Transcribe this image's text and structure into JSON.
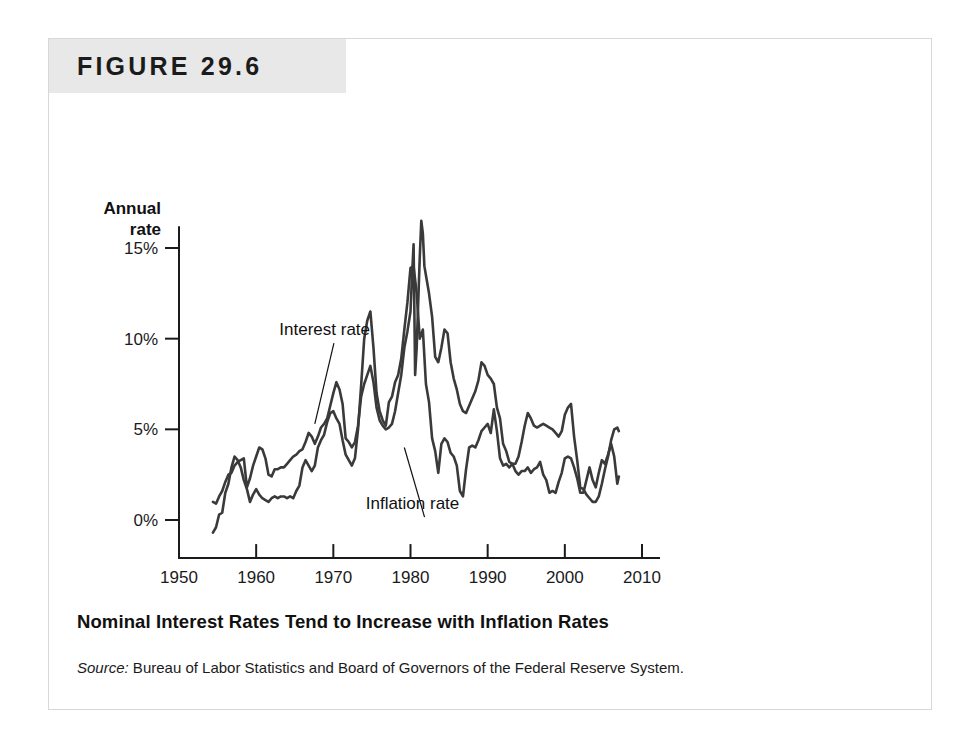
{
  "figure": {
    "number_label": "FIGURE 29.6",
    "caption": "Nominal Interest Rates Tend to Increase with Inflation Rates",
    "source_label": "Source:",
    "source_text": " Bureau of Labor Statistics and Board of Governors of the Federal Reserve System."
  },
  "chart_data": {
    "type": "line",
    "title": "Nominal Interest Rates Tend to Increase with Inflation Rates",
    "xlabel": "Year",
    "ylabel": "Annual rate",
    "ylabel_line1": "Annual",
    "ylabel_line2": "rate",
    "xlim": [
      1950,
      2010
    ],
    "ylim": [
      -2,
      17
    ],
    "grid": false,
    "legend_position": "inline-annotations",
    "xticks": [
      1950,
      1960,
      1970,
      1980,
      1990,
      2000,
      2010
    ],
    "xtick_labels": [
      "1950",
      "1960",
      "1970",
      "1980",
      "1990",
      "2000",
      "2010"
    ],
    "yticks": [
      0,
      5,
      10,
      15
    ],
    "ytick_labels": [
      "0%",
      "5%",
      "10%",
      "15%"
    ],
    "annotations": [
      {
        "label": "Interest rate",
        "text_x": 1963.0,
        "text_y": 10.2,
        "point_x": 1967.6,
        "point_y": 5.3
      },
      {
        "label": "Inflation rate",
        "text_x": 1974.2,
        "text_y": 0.6,
        "point_x": 1979.2,
        "point_y": 4.0
      }
    ],
    "series": [
      {
        "name": "Interest rate",
        "color": "#3a3a3a",
        "x": [
          1954.4,
          1954.8,
          1955.2,
          1955.6,
          1956.0,
          1956.4,
          1956.8,
          1957.2,
          1957.6,
          1958.0,
          1958.4,
          1958.8,
          1959.2,
          1959.6,
          1960.0,
          1960.4,
          1960.8,
          1961.2,
          1961.6,
          1962.0,
          1962.4,
          1962.8,
          1963.2,
          1963.6,
          1964.0,
          1964.4,
          1964.8,
          1965.2,
          1965.6,
          1966.0,
          1966.4,
          1966.8,
          1967.2,
          1967.6,
          1968.0,
          1968.4,
          1968.8,
          1969.2,
          1969.6,
          1970.0,
          1970.4,
          1970.8,
          1971.2,
          1971.6,
          1972.0,
          1972.4,
          1972.8,
          1973.2,
          1973.6,
          1974.0,
          1974.4,
          1974.8,
          1975.2,
          1975.6,
          1976.0,
          1976.4,
          1976.8,
          1977.2,
          1977.6,
          1978.0,
          1978.4,
          1978.8,
          1979.2,
          1979.6,
          1980.0,
          1980.2,
          1980.4,
          1980.6,
          1980.8,
          1981.0,
          1981.2,
          1981.4,
          1981.6,
          1981.8,
          1982.0,
          1982.4,
          1982.8,
          1983.2,
          1983.6,
          1984.0,
          1984.4,
          1984.8,
          1985.2,
          1985.6,
          1986.0,
          1986.4,
          1986.8,
          1987.2,
          1987.6,
          1988.0,
          1988.4,
          1988.8,
          1989.2,
          1989.6,
          1990.0,
          1990.4,
          1990.8,
          1991.2,
          1991.6,
          1992.0,
          1992.4,
          1992.8,
          1993.2,
          1993.6,
          1994.0,
          1994.4,
          1994.8,
          1995.2,
          1995.6,
          1996.0,
          1996.4,
          1996.8,
          1997.2,
          1997.6,
          1998.0,
          1998.4,
          1998.8,
          1999.2,
          1999.6,
          2000.0,
          2000.4,
          2000.8,
          2001.2,
          2001.6,
          2002.0,
          2002.4,
          2002.8,
          2003.2,
          2003.6,
          2004.0,
          2004.4,
          2004.8,
          2005.2,
          2005.6,
          2006.0,
          2006.4,
          2006.8,
          2007.0
        ],
        "y": [
          1.0,
          0.9,
          1.3,
          1.6,
          2.1,
          2.5,
          2.6,
          3.0,
          3.2,
          3.3,
          3.4,
          1.8,
          2.3,
          3.0,
          3.5,
          4.0,
          3.9,
          3.4,
          2.5,
          2.4,
          2.8,
          2.8,
          2.9,
          2.9,
          3.1,
          3.3,
          3.5,
          3.6,
          3.8,
          3.9,
          4.3,
          4.8,
          4.6,
          4.2,
          4.6,
          5.1,
          5.3,
          5.6,
          6.3,
          7.0,
          7.6,
          7.2,
          6.4,
          4.5,
          4.3,
          4.0,
          4.3,
          5.2,
          6.8,
          7.5,
          8.0,
          8.5,
          7.6,
          6.2,
          5.5,
          5.2,
          5.0,
          5.1,
          5.3,
          6.0,
          7.0,
          8.0,
          9.5,
          10.4,
          11.5,
          13.5,
          15.2,
          8.0,
          9.5,
          12.0,
          14.5,
          16.5,
          15.8,
          14.0,
          13.5,
          12.5,
          11.2,
          9.0,
          8.7,
          9.5,
          10.5,
          10.3,
          8.7,
          7.8,
          7.2,
          6.4,
          6.0,
          5.9,
          6.3,
          6.7,
          7.1,
          7.7,
          8.7,
          8.5,
          8.0,
          7.8,
          7.5,
          6.2,
          5.6,
          4.2,
          3.8,
          3.2,
          3.1,
          3.1,
          3.5,
          4.3,
          5.2,
          5.9,
          5.6,
          5.2,
          5.1,
          5.2,
          5.3,
          5.2,
          5.1,
          5.0,
          4.8,
          4.6,
          4.9,
          5.8,
          6.2,
          6.4,
          4.6,
          3.3,
          1.8,
          1.7,
          1.4,
          1.2,
          1.0,
          1.0,
          1.3,
          2.0,
          2.8,
          3.5,
          4.4,
          5.0,
          5.1,
          4.9
        ]
      },
      {
        "name": "Inflation rate",
        "color": "#3a3a3a",
        "x": [
          1954.4,
          1954.8,
          1955.2,
          1955.6,
          1956.0,
          1956.4,
          1956.8,
          1957.2,
          1957.6,
          1958.0,
          1958.4,
          1958.8,
          1959.2,
          1959.6,
          1960.0,
          1960.4,
          1960.8,
          1961.2,
          1961.6,
          1962.0,
          1962.4,
          1962.8,
          1963.2,
          1963.6,
          1964.0,
          1964.4,
          1964.8,
          1965.2,
          1965.6,
          1966.0,
          1966.4,
          1966.8,
          1967.2,
          1967.6,
          1968.0,
          1968.4,
          1968.8,
          1969.2,
          1969.6,
          1970.0,
          1970.4,
          1970.8,
          1971.2,
          1971.6,
          1972.0,
          1972.4,
          1972.8,
          1973.2,
          1973.6,
          1974.0,
          1974.4,
          1974.8,
          1975.2,
          1975.6,
          1976.0,
          1976.4,
          1976.8,
          1977.2,
          1977.6,
          1978.0,
          1978.4,
          1978.8,
          1979.2,
          1979.6,
          1980.0,
          1980.4,
          1980.8,
          1981.2,
          1981.6,
          1982.0,
          1982.4,
          1982.8,
          1983.2,
          1983.6,
          1984.0,
          1984.4,
          1984.8,
          1985.2,
          1985.6,
          1986.0,
          1986.4,
          1986.8,
          1987.2,
          1987.6,
          1988.0,
          1988.4,
          1988.8,
          1989.2,
          1989.6,
          1990.0,
          1990.4,
          1990.8,
          1991.2,
          1991.6,
          1992.0,
          1992.4,
          1992.8,
          1993.2,
          1993.6,
          1994.0,
          1994.4,
          1994.8,
          1995.2,
          1995.6,
          1996.0,
          1996.4,
          1996.8,
          1997.2,
          1997.6,
          1998.0,
          1998.4,
          1998.8,
          1999.2,
          1999.6,
          2000.0,
          2000.4,
          2000.8,
          2001.2,
          2001.6,
          2002.0,
          2002.4,
          2002.8,
          2003.2,
          2003.6,
          2004.0,
          2004.4,
          2004.8,
          2005.2,
          2005.6,
          2006.0,
          2006.4,
          2006.8,
          2007.0
        ],
        "y": [
          -0.7,
          -0.4,
          0.3,
          0.4,
          1.5,
          2.0,
          2.9,
          3.5,
          3.3,
          2.9,
          2.2,
          1.7,
          1.0,
          1.4,
          1.7,
          1.4,
          1.2,
          1.1,
          1.0,
          1.2,
          1.3,
          1.2,
          1.3,
          1.3,
          1.2,
          1.3,
          1.2,
          1.6,
          1.9,
          2.9,
          3.3,
          3.0,
          2.7,
          3.0,
          4.0,
          4.4,
          4.7,
          5.4,
          5.9,
          6.0,
          5.6,
          5.3,
          4.4,
          3.6,
          3.3,
          3.0,
          3.4,
          5.0,
          7.4,
          10.0,
          11.0,
          11.5,
          9.5,
          7.0,
          6.0,
          5.5,
          5.2,
          6.5,
          6.8,
          7.6,
          8.0,
          8.9,
          10.5,
          12.0,
          13.9,
          14.0,
          12.5,
          10.0,
          10.5,
          7.5,
          6.5,
          4.5,
          3.8,
          2.6,
          4.2,
          4.5,
          4.3,
          3.7,
          3.5,
          3.0,
          1.6,
          1.3,
          2.8,
          4.0,
          4.1,
          4.0,
          4.4,
          4.9,
          5.1,
          5.3,
          4.8,
          6.1,
          4.9,
          3.4,
          3.0,
          3.1,
          2.9,
          3.1,
          2.7,
          2.5,
          2.7,
          2.7,
          2.9,
          2.6,
          2.8,
          2.9,
          3.2,
          2.5,
          2.2,
          1.5,
          1.6,
          1.5,
          2.1,
          2.6,
          3.4,
          3.5,
          3.4,
          2.9,
          2.3,
          1.5,
          1.5,
          2.2,
          2.9,
          2.2,
          1.8,
          2.6,
          3.3,
          3.1,
          3.6,
          4.2,
          3.5,
          2.0,
          2.4
        ]
      }
    ]
  }
}
